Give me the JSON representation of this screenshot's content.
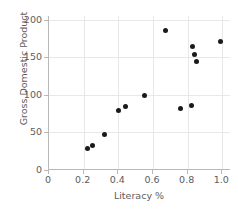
{
  "chart_data": {
    "type": "scatter",
    "title": "",
    "xlabel": "Literacy %",
    "ylabel": "Gross Domestic Product",
    "xlim": [
      0,
      1.05
    ],
    "ylim": [
      0,
      205
    ],
    "grid": true,
    "legend": null,
    "marker_color": "#1a1a1a",
    "grid_color": "#e8e8e8",
    "axis_color": "#b9b9b9",
    "text_color": "#5c5c5c",
    "xticks": [
      0,
      0.2,
      0.4,
      0.6,
      0.8,
      1.0
    ],
    "xticklabels": [
      "0",
      "0.2",
      "0.4",
      "0.6",
      "0.8",
      "1.0"
    ],
    "yticks": [
      0,
      50,
      100,
      150,
      200
    ],
    "yticklabels": [
      "0",
      "50",
      "100",
      "150",
      "200"
    ],
    "points": [
      {
        "x": 0.22,
        "y": 29
      },
      {
        "x": 0.25,
        "y": 32
      },
      {
        "x": 0.32,
        "y": 47
      },
      {
        "x": 0.4,
        "y": 79
      },
      {
        "x": 0.44,
        "y": 85
      },
      {
        "x": 0.55,
        "y": 99
      },
      {
        "x": 0.67,
        "y": 186
      },
      {
        "x": 0.76,
        "y": 82
      },
      {
        "x": 0.82,
        "y": 86
      },
      {
        "x": 0.83,
        "y": 164
      },
      {
        "x": 0.84,
        "y": 154
      },
      {
        "x": 0.85,
        "y": 145
      },
      {
        "x": 0.99,
        "y": 171
      }
    ]
  }
}
